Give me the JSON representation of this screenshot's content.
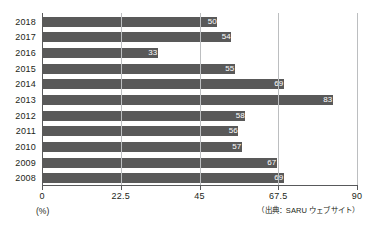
{
  "chart_data": {
    "type": "bar",
    "orientation": "horizontal",
    "title": "",
    "subtitle": "",
    "xlabel": "(%)",
    "ylabel": "",
    "categories": [
      "2018",
      "2017",
      "2016",
      "2015",
      "2014",
      "2013",
      "2012",
      "2011",
      "2010",
      "2009",
      "2008"
    ],
    "values": [
      50,
      54,
      33,
      55,
      69,
      83,
      58,
      56,
      57,
      67,
      69
    ],
    "series": [
      {
        "name": "",
        "values": [
          50,
          54,
          33,
          55,
          69,
          83,
          58,
          56,
          57,
          67,
          69
        ]
      }
    ],
    "xlim": [
      0,
      90
    ],
    "xticks": [
      0,
      22.5,
      45,
      67.5,
      90
    ],
    "xtick_labels": [
      "0",
      "22.5",
      "45",
      "67.5",
      "90"
    ],
    "grid": true,
    "grid_axis": "x",
    "legend": false,
    "legend_position": "none",
    "data_labels": true,
    "data_label_position": "inside-end",
    "bar_color": "#595959",
    "data_label_color": "#ffffff",
    "gridline_color": "#bcbec0",
    "axis_color": "#58595b",
    "background_color": "#ffffff"
  },
  "axis": {
    "unit_label": "(%)"
  },
  "footer": {
    "source_note": "（出典：SARU ウェブサイト）"
  }
}
